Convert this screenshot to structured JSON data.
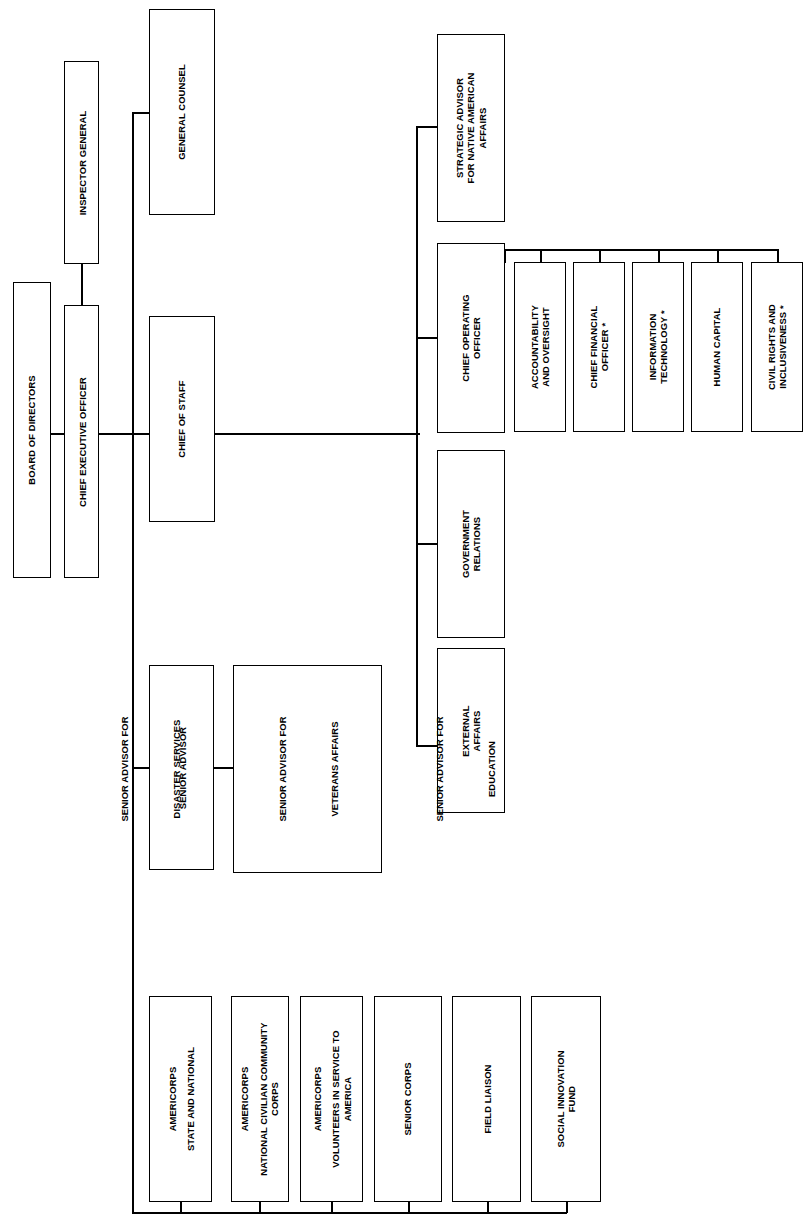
{
  "chart": {
    "orientation": "rotated-90-ccw",
    "line_color": "#000000",
    "box_fill": "#ffffff",
    "footnote_marker": "*"
  },
  "nodes": {
    "board_of_directors": {
      "line1": "BOARD OF DIRECTORS"
    },
    "chief_executive_officer": {
      "line1": "CHIEF EXECUTIVE OFFICER"
    },
    "inspector_general": {
      "line1": "INSPECTOR GENERAL"
    },
    "general_counsel": {
      "line1": "GENERAL COUNSEL"
    },
    "chief_of_staff": {
      "line1": "CHIEF OF STAFF"
    },
    "strategic_advisor": {
      "line1": "STRATEGIC ADVISOR",
      "line2": "FOR NATIVE AMERICAN",
      "line3": "AFFAIRS"
    },
    "chief_operating_officer": {
      "line1": "CHIEF OPERATING",
      "line2": "OFFICER"
    },
    "accountability_and_oversight": {
      "line1": "ACCOUNTABILITY",
      "line2": "AND OVERSIGHT"
    },
    "chief_financial_officer": {
      "line1": "CHIEF FINANCIAL",
      "line2": "OFFICER *"
    },
    "information_technology": {
      "line1": "INFORMATION",
      "line2": "TECHNOLOGY *"
    },
    "human_capital": {
      "line1": "HUMAN CAPITAL"
    },
    "civil_rights_and_inclusiveness": {
      "line1": "CIVIL RIGHTS AND",
      "line2": "INCLUSIVENESS *"
    },
    "government_relations": {
      "line1": "GOVERNMENT",
      "line2": "RELATIONS"
    },
    "external_affairs": {
      "line1": "EXTERNAL",
      "line2": "AFFAIRS"
    },
    "senior_advisor": {
      "line1": "SENIOR ADVISOR"
    },
    "senior_advisor_list": {
      "entry1_line1": "SENIOR ADVISOR FOR",
      "entry1_line2": "DISASTER SERVICES",
      "entry2_line1": "SENIOR ADVISOR FOR",
      "entry2_line2": "VETERANS AFFAIRS",
      "entry3_line1": "SENIOR ADVISOR FOR",
      "entry3_line2": "EDUCATION"
    },
    "americorps_state_and_national": {
      "line1": "AMERICORPS",
      "line2": "STATE AND NATIONAL"
    },
    "americorps_nccc": {
      "line1": "AMERICORPS",
      "line2": "NATIONAL CIVILIAN COMMUNITY",
      "line3": "CORPS"
    },
    "americorps_vista": {
      "line1": "AMERICORPS",
      "line2": "VOLUNTEERS IN SERVICE TO",
      "line3": "AMERICA"
    },
    "senior_corps": {
      "line1": "SENIOR CORPS"
    },
    "field_liaison": {
      "line1": "FIELD LIAISON"
    },
    "social_innovation_fund": {
      "line1": "SOCIAL INNOVATION",
      "line2": "FUND"
    }
  }
}
